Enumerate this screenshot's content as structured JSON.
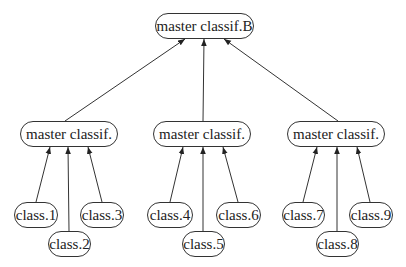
{
  "diagram": {
    "type": "tree",
    "root": {
      "id": "root",
      "label": "master classif.B",
      "box": [
        155,
        13,
        99,
        26
      ]
    },
    "masters": [
      {
        "id": "m1",
        "label": "master classif.",
        "box": [
          20,
          121,
          98,
          26
        ]
      },
      {
        "id": "m2",
        "label": "master classif.",
        "box": [
          153,
          121,
          98,
          26
        ]
      },
      {
        "id": "m3",
        "label": "master classif.",
        "box": [
          287,
          121,
          98,
          26
        ]
      }
    ],
    "classes": [
      {
        "id": "c1",
        "label": "class.1",
        "box": [
          14,
          202,
          44,
          26
        ],
        "parent": "m1"
      },
      {
        "id": "c2",
        "label": "class.2",
        "box": [
          48,
          231,
          43,
          26
        ],
        "parent": "m1"
      },
      {
        "id": "c3",
        "label": "class.3",
        "box": [
          80,
          202,
          44,
          26
        ],
        "parent": "m1"
      },
      {
        "id": "c4",
        "label": "class.4",
        "box": [
          147,
          202,
          46,
          26
        ],
        "parent": "m2"
      },
      {
        "id": "c5",
        "label": "class.5",
        "box": [
          182,
          231,
          43,
          26
        ],
        "parent": "m2"
      },
      {
        "id": "c6",
        "label": "class.6",
        "box": [
          216,
          202,
          45,
          26
        ],
        "parent": "m2"
      },
      {
        "id": "c7",
        "label": "class.7",
        "box": [
          282,
          202,
          43,
          26
        ],
        "parent": "m3"
      },
      {
        "id": "c8",
        "label": "class.8",
        "box": [
          316,
          231,
          43,
          26
        ],
        "parent": "m3"
      },
      {
        "id": "c9",
        "label": "class.9",
        "box": [
          349,
          202,
          44,
          26
        ],
        "parent": "m3"
      }
    ],
    "edges": [
      {
        "from": "m1",
        "to": "root",
        "x1": 65,
        "y1": 121,
        "x2": 185,
        "y2": 39
      },
      {
        "from": "m2",
        "to": "root",
        "x1": 203,
        "y1": 121,
        "x2": 204,
        "y2": 39
      },
      {
        "from": "m3",
        "to": "root",
        "x1": 338,
        "y1": 121,
        "x2": 224,
        "y2": 39
      },
      {
        "from": "c1",
        "to": "m1",
        "x1": 36,
        "y1": 202,
        "x2": 50,
        "y2": 147
      },
      {
        "from": "c2",
        "to": "m1",
        "x1": 69,
        "y1": 231,
        "x2": 68,
        "y2": 147
      },
      {
        "from": "c3",
        "to": "m1",
        "x1": 102,
        "y1": 202,
        "x2": 88,
        "y2": 147
      },
      {
        "from": "c4",
        "to": "m2",
        "x1": 170,
        "y1": 202,
        "x2": 183,
        "y2": 147
      },
      {
        "from": "c5",
        "to": "m2",
        "x1": 203,
        "y1": 231,
        "x2": 203,
        "y2": 147
      },
      {
        "from": "c6",
        "to": "m2",
        "x1": 238,
        "y1": 202,
        "x2": 223,
        "y2": 147
      },
      {
        "from": "c7",
        "to": "m3",
        "x1": 303,
        "y1": 202,
        "x2": 317,
        "y2": 147
      },
      {
        "from": "c8",
        "to": "m3",
        "x1": 337,
        "y1": 231,
        "x2": 337,
        "y2": 147
      },
      {
        "from": "c9",
        "to": "m3",
        "x1": 370,
        "y1": 202,
        "x2": 357,
        "y2": 147
      }
    ],
    "colors": {
      "stroke": "#333333",
      "text": "#222222",
      "background": "#ffffff"
    }
  }
}
